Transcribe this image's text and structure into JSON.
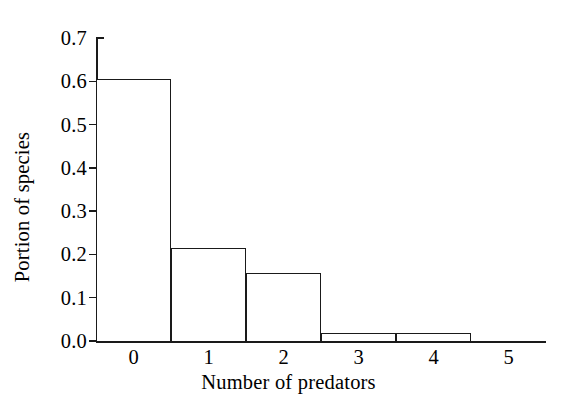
{
  "chart_data": {
    "type": "bar",
    "title": "",
    "xlabel": "Number of predators",
    "ylabel": "Portion of species",
    "categories": [
      "0",
      "1",
      "2",
      "3",
      "4",
      "5"
    ],
    "values": [
      0.605,
      0.215,
      0.158,
      0.018,
      0.018,
      0.0
    ],
    "series": [
      {
        "name": "Portion of species",
        "values": [
          0.605,
          0.215,
          0.158,
          0.018,
          0.018,
          0.0
        ]
      }
    ],
    "ylim": [
      0.0,
      0.7
    ],
    "xlim": [
      -0.5,
      5.5
    ],
    "y_ticks": [
      0.0,
      0.1,
      0.2,
      0.3,
      0.4,
      0.5,
      0.6,
      0.7
    ],
    "y_tick_labels": [
      "0.0",
      "0.1",
      "0.2",
      "0.3",
      "0.4",
      "0.5",
      "0.6",
      "0.7"
    ],
    "x_tick_labels": [
      "0",
      "1",
      "2",
      "3",
      "4",
      "5"
    ],
    "grid": false,
    "legend": false,
    "legend_position": "none",
    "bar_style": "open-outline",
    "bar_fill_color": "#ffffff",
    "bar_edge_color": "#1a1a1a",
    "axis_color": "#1a1a1a",
    "background_color": "#ffffff"
  }
}
